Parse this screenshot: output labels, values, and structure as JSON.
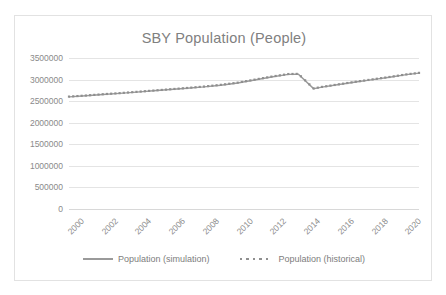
{
  "chart_data": {
    "type": "line",
    "title": "SBY Population (People)",
    "xlabel": "",
    "ylabel": "",
    "grid": true,
    "legend_position": "bottom",
    "xlim": [
      2000,
      2020.75
    ],
    "ylim": [
      0,
      3500000
    ],
    "y_ticks": [
      0,
      500000,
      1000000,
      1500000,
      2000000,
      2500000,
      3000000,
      3500000
    ],
    "y_tick_labels": [
      "0",
      "500000",
      "1000000",
      "1500000",
      "2000000",
      "2500000",
      "3000000",
      "3500000"
    ],
    "x_ticks": [
      2000,
      2002,
      2004,
      2006,
      2008,
      2010,
      2012,
      2014,
      2016,
      2018,
      2020
    ],
    "x_tick_labels": [
      "2000",
      "2002",
      "2004",
      "2006",
      "2008",
      "2010",
      "2012",
      "2014",
      "2016",
      "2018",
      "2020"
    ],
    "series": [
      {
        "name": "Population (simulation)",
        "style": "solid-line",
        "color": "#9a9a9a",
        "x": [
          2000,
          2001,
          2002,
          2003,
          2004,
          2005,
          2006,
          2007,
          2008,
          2009,
          2010,
          2011,
          2012,
          2013,
          2013.6,
          2014.5,
          2015,
          2016,
          2017,
          2018,
          2019,
          2020,
          2020.75
        ],
        "values": [
          2600000,
          2625000,
          2655000,
          2680000,
          2710000,
          2740000,
          2770000,
          2800000,
          2830000,
          2870000,
          2920000,
          2990000,
          3060000,
          3120000,
          3125000,
          2790000,
          2825000,
          2885000,
          2945000,
          3000000,
          3055000,
          3115000,
          3150000
        ]
      },
      {
        "name": "Population (historical)",
        "style": "square-markers",
        "color": "#8f8f8f",
        "x": [
          2000,
          2001,
          2002,
          2003,
          2004,
          2005,
          2006,
          2007,
          2008,
          2009,
          2010,
          2011,
          2012,
          2013,
          2013.6,
          2014.5,
          2015,
          2016,
          2017,
          2018,
          2019,
          2020,
          2020.75
        ],
        "values": [
          2605000,
          2630000,
          2660000,
          2685000,
          2715000,
          2745000,
          2775000,
          2805000,
          2838000,
          2878000,
          2928000,
          2998000,
          3068000,
          3128000,
          3132000,
          2795000,
          2830000,
          2890000,
          2950000,
          3005000,
          3060000,
          3120000,
          3155000
        ]
      }
    ]
  },
  "legend": {
    "entries": [
      {
        "label": "Population (simulation)"
      },
      {
        "label": "Population (historical)"
      }
    ]
  }
}
